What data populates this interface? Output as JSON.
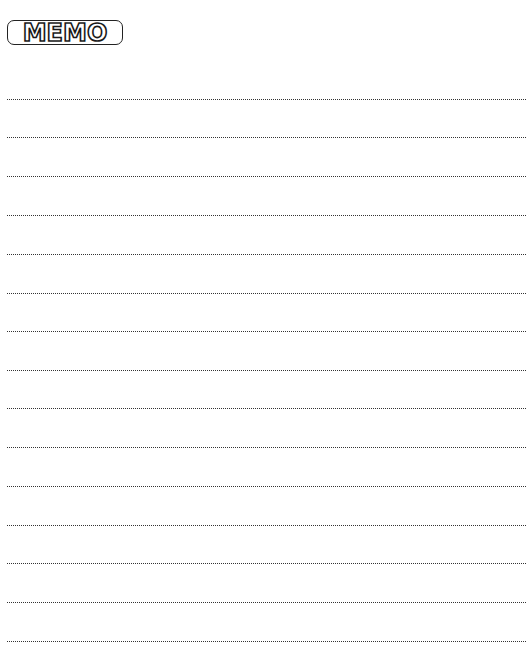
{
  "header": {
    "title": "MEMO"
  },
  "memo_lines": {
    "count": 15,
    "positions_y": [
      99,
      137,
      176,
      215,
      254,
      293,
      331,
      370,
      408,
      447,
      486,
      525,
      563,
      602,
      641
    ],
    "style": "dotted",
    "color": "#333333"
  }
}
